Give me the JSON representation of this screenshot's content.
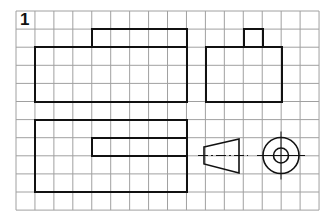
{
  "exercise": {
    "number": "1"
  },
  "grid": {
    "origin_x": 16,
    "origin_y": 11,
    "cols": 16,
    "rows": 11,
    "cell_w": 18.94,
    "cell_h": 18.1,
    "line_color": "#a0a0a0"
  },
  "colors": {
    "outline": "#111111",
    "background": "#ffffff"
  },
  "views": {
    "front": {
      "name": "front-view",
      "parts": [
        {
          "x": 92,
          "y": 29,
          "w": 95,
          "h": 18
        },
        {
          "x": 35,
          "y": 47,
          "w": 152,
          "h": 55
        }
      ]
    },
    "side": {
      "name": "side-view",
      "parts": [
        {
          "x": 244,
          "y": 29,
          "w": 19,
          "h": 18
        },
        {
          "x": 206,
          "y": 47,
          "w": 76,
          "h": 55
        }
      ]
    },
    "top": {
      "name": "top-view",
      "parts": [
        {
          "x": 35,
          "y": 120,
          "w": 152,
          "h": 72
        },
        {
          "x": 92,
          "y": 138,
          "w": 95,
          "h": 18
        }
      ]
    },
    "frustum": {
      "name": "frustum-view",
      "points": "204,147 239,139 239,173 204,164",
      "centerline": {
        "x1": 198,
        "y1": 155.5,
        "x2": 248,
        "y2": 155.5
      }
    },
    "circle": {
      "name": "circle-view",
      "cx": 281,
      "cy": 155.5,
      "r_outer": 18,
      "r_inner": 7.5,
      "cross_ext": 24
    }
  }
}
